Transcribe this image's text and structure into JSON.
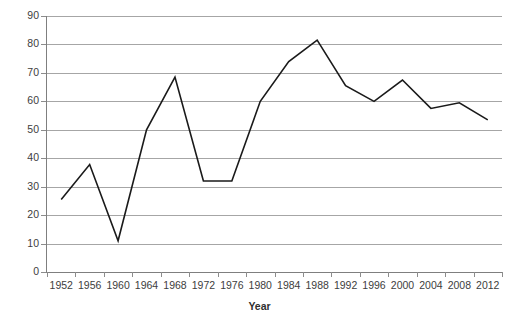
{
  "chart_data": {
    "type": "line",
    "title": "",
    "xlabel": "Year",
    "ylabel": "",
    "x": [
      1952,
      1956,
      1960,
      1964,
      1968,
      1972,
      1976,
      1980,
      1984,
      1988,
      1992,
      1996,
      2000,
      2004,
      2008,
      2012
    ],
    "categories": [
      "1952",
      "1956",
      "1960",
      "1964",
      "1968",
      "1972",
      "1976",
      "1980",
      "1984",
      "1988",
      "1992",
      "1996",
      "2000",
      "2004",
      "2008",
      "2012"
    ],
    "values": [
      25.5,
      37.8,
      11.0,
      50.0,
      68.5,
      32.0,
      32.0,
      60.0,
      74.0,
      81.5,
      65.5,
      60.0,
      67.5,
      57.5,
      59.5,
      53.5
    ],
    "ylim": [
      0,
      90
    ],
    "ytick_step": 10,
    "yticks": [
      "0",
      "10",
      "20",
      "30",
      "40",
      "50",
      "60",
      "70",
      "80",
      "90"
    ],
    "grid": true,
    "grid_axis": "y",
    "legend": false,
    "legend_position": "none",
    "line_color": "#1a1a1a",
    "grid_color": "#a6a6a6",
    "axis_color": "#7f7f7f",
    "background_color": "#ffffff",
    "line_width": 1.6
  }
}
